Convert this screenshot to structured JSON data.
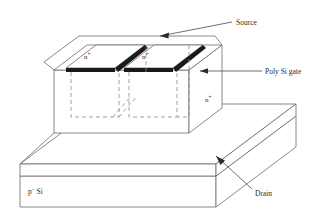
{
  "figure": {
    "type": "device-cross-section-3d",
    "title": ""
  },
  "labels": {
    "source": "Source",
    "poly_si_gate": "Poly Si gate",
    "drain": "Drain",
    "substrate": "p",
    "substrate_sup": "−",
    "substrate_tail": " Si",
    "n_plus_left": "n",
    "n_plus_left_sup": "+",
    "n_plus_right": "n",
    "n_plus_right_sup": "+",
    "n_plus_drain": "n",
    "n_plus_drain_sup": "+"
  },
  "colors": {
    "outline": "#6b6b6b",
    "outline_dark": "#555555",
    "contact_bar": "#1a1a1a",
    "dashed": "#8a8a8a",
    "text": "#2b2b2b",
    "leader": "#4a4a4a",
    "fill": "#ffffff"
  },
  "regions": [
    {
      "name": "poly-si-gate-block",
      "label": "Poly Si gate"
    },
    {
      "name": "source-well-left",
      "label": "n+"
    },
    {
      "name": "source-well-right",
      "label": "n+"
    },
    {
      "name": "n-plus-drain-layer",
      "label": "n+"
    },
    {
      "name": "p-minus-substrate",
      "label": "p- Si"
    }
  ],
  "annotations": [
    {
      "name": "source-callout",
      "text": "Source",
      "arrow": "points-left-down-into-right-source-well"
    },
    {
      "name": "poly-si-gate-callout",
      "text": "Poly Si gate",
      "arrow": "points-left-to-gate-block-side"
    },
    {
      "name": "drain-callout",
      "text": "Drain",
      "arrow": "points-up-left-to-n-plus-layer-edge"
    }
  ]
}
